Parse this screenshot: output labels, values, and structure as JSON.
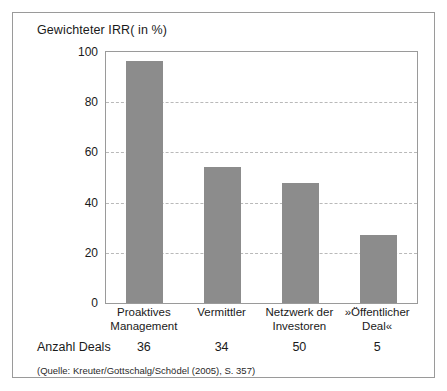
{
  "chart_data": {
    "type": "bar",
    "title": "Gewichteter IRR( in %)",
    "xlabel": "",
    "ylabel": "Gewichteter IRR( in %)",
    "ylim": [
      0,
      100
    ],
    "yticks": [
      0,
      20,
      40,
      60,
      80,
      100
    ],
    "grid": true,
    "legend": "none",
    "bar_color": "#8c8c8c",
    "categories": [
      "Proaktives Management",
      "Vermittler",
      "Netzwerk der Investoren",
      "»Öffentlicher Deal«"
    ],
    "category_lines": [
      [
        "Proaktives",
        "Management"
      ],
      [
        "Vermittler"
      ],
      [
        "Netzwerk der",
        "Investoren"
      ],
      [
        "»Öffentlicher",
        "Deal«"
      ]
    ],
    "values": [
      96.5,
      54,
      48,
      27
    ],
    "annotation_row": {
      "label": "Anzahl Deals",
      "values": [
        "36",
        "34",
        "50",
        "5"
      ]
    },
    "source": "(Quelle: Kreuter/Gottschalg/Schödel (2005), S. 357)"
  }
}
